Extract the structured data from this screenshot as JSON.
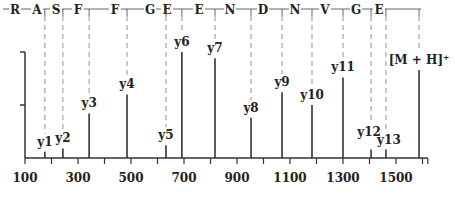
{
  "chart_data": {
    "type": "bar",
    "subtype": "mass-spectrum-stick",
    "title": "",
    "xlabel": "",
    "ylabel": "",
    "xlim": [
      100,
      1620
    ],
    "ylim": [
      0,
      100
    ],
    "grid": false,
    "legend": null,
    "x_ticks": [
      100,
      300,
      500,
      700,
      900,
      1100,
      1300,
      1500
    ],
    "x_tick_labels": [
      "100",
      "300",
      "500",
      "700",
      "900",
      "1100",
      "1300",
      "1500"
    ],
    "y_ticks": [
      50,
      100
    ],
    "sequence": [
      "R",
      "A",
      "S",
      "F",
      "F",
      "G",
      "E",
      "E",
      "N",
      "D",
      "N",
      "V",
      "G",
      "E"
    ],
    "peaks": [
      {
        "label": "y1",
        "mz": 175,
        "intensity": 6
      },
      {
        "label": "y2",
        "mz": 243,
        "intensity": 9
      },
      {
        "label": "y3",
        "mz": 342,
        "intensity": 42
      },
      {
        "label": "y4",
        "mz": 485,
        "intensity": 60
      },
      {
        "label": "y5",
        "mz": 632,
        "intensity": 12
      },
      {
        "label": "y6",
        "mz": 692,
        "intensity": 100
      },
      {
        "label": "y7",
        "mz": 817,
        "intensity": 94
      },
      {
        "label": "y8",
        "mz": 953,
        "intensity": 38
      },
      {
        "label": "y9",
        "mz": 1070,
        "intensity": 62
      },
      {
        "label": "y10",
        "mz": 1183,
        "intensity": 50
      },
      {
        "label": "y11",
        "mz": 1300,
        "intensity": 76
      },
      {
        "label": "y12",
        "mz": 1406,
        "intensity": 8
      },
      {
        "label": "y13",
        "mz": 1462,
        "intensity": 8
      },
      {
        "label": "[M + H]⁺",
        "mz": 1587,
        "intensity": 83
      }
    ]
  }
}
